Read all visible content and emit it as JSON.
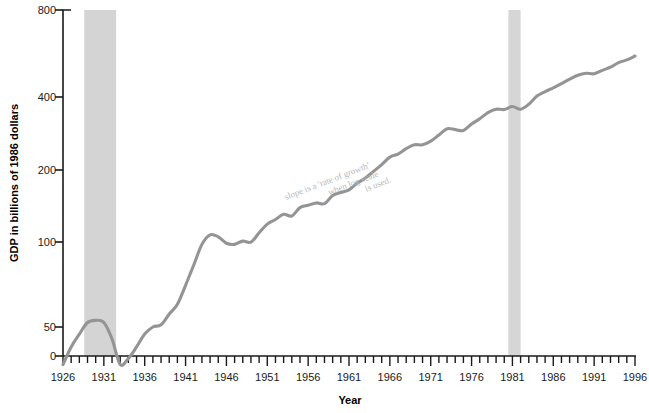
{
  "chart_data": {
    "type": "line",
    "title": "",
    "subtitle": "",
    "xlabel": "Year",
    "ylabel": "GDP in billions of 1986 dollars",
    "yscale": "log",
    "xlim": [
      1926,
      1996
    ],
    "ylim": [
      25,
      800
    ],
    "grid": false,
    "legend": null,
    "y_tick_labels": [
      "800",
      "400",
      "200",
      "100",
      "50",
      "0"
    ],
    "y_tick_values": [
      800,
      400,
      200,
      100,
      50,
      0
    ],
    "x_tick_labels": [
      "1926",
      "1931",
      "1936",
      "1941",
      "1946",
      "1951",
      "1956",
      "1961",
      "1966",
      "1971",
      "1976",
      "1981",
      "1986",
      "1991",
      "1996"
    ],
    "x_tick_values": [
      1926,
      1931,
      1936,
      1941,
      1946,
      1951,
      1956,
      1961,
      1966,
      1971,
      1976,
      1981,
      1986,
      1991,
      1996
    ],
    "x_minor_tick_step": 1,
    "series": [
      {
        "name": "GDP",
        "color": "#949494",
        "x": [
          1926,
          1927,
          1928,
          1929,
          1930,
          1931,
          1932,
          1933,
          1934,
          1935,
          1936,
          1937,
          1938,
          1939,
          1940,
          1941,
          1942,
          1943,
          1944,
          1945,
          1946,
          1947,
          1948,
          1949,
          1950,
          1951,
          1952,
          1953,
          1954,
          1955,
          1956,
          1957,
          1958,
          1959,
          1960,
          1961,
          1962,
          1963,
          1964,
          1965,
          1966,
          1967,
          1968,
          1969,
          1970,
          1971,
          1972,
          1973,
          1974,
          1975,
          1976,
          1977,
          1978,
          1979,
          1980,
          1981,
          1982,
          1983,
          1984,
          1985,
          1986,
          1987,
          1988,
          1989,
          1990,
          1991,
          1992,
          1993,
          1994,
          1995,
          1996
        ],
        "y": [
          36,
          42,
          47,
          52,
          53,
          52,
          45,
          36,
          38,
          42,
          47,
          50,
          51,
          56,
          61,
          72,
          86,
          103,
          112,
          110,
          104,
          103,
          106,
          105,
          114,
          123,
          128,
          134,
          132,
          142,
          145,
          148,
          147,
          158,
          162,
          166,
          176,
          184,
          195,
          207,
          221,
          227,
          238,
          246,
          246,
          254,
          268,
          283,
          281,
          279,
          295,
          309,
          326,
          336,
          335,
          344,
          336,
          351,
          377,
          392,
          405,
          420,
          437,
          452,
          460,
          458,
          472,
          485,
          505,
          517,
          535
        ]
      }
    ],
    "shaded_bands": [
      {
        "name": "great-depression-band",
        "start": 1928.6,
        "end": 1932.5,
        "color": "#d4d4d4"
      },
      {
        "name": "early-1980s-recession-band",
        "start": 1980.5,
        "end": 1982.0,
        "color": "#d6d6d6"
      }
    ],
    "annotations": [
      {
        "name": "handwritten-note",
        "lines": [
          "slope is a 'rate of growth'",
          "when log scale",
          "is used."
        ],
        "color": "#c0c0c0",
        "rotation": -20
      }
    ]
  },
  "axis": {
    "line_color": "#1a1a1a"
  }
}
